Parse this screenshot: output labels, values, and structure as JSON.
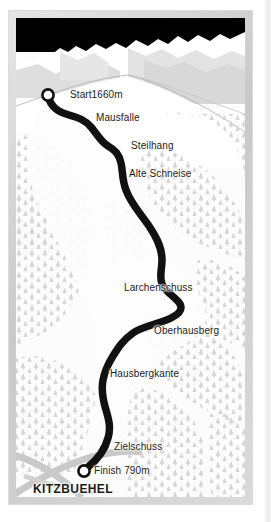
{
  "map": {
    "title_region": "Kitzbuehel downhill course map",
    "town_label": "KITZBUEHEL",
    "start_marker": {
      "label": "Start1660m",
      "x": 41,
      "y": 87
    },
    "finish_marker": {
      "label": "Finish 790m",
      "x": 77,
      "y": 463
    },
    "section_labels": [
      {
        "text": "Mausfalle",
        "x": 84,
        "y": 101
      },
      {
        "text": "Steilhang",
        "x": 119,
        "y": 129
      },
      {
        "text": "Alte Schneise",
        "x": 126,
        "y": 158
      },
      {
        "text": "Larchenschuss",
        "x": 123,
        "y": 275
      },
      {
        "text": "Oberhausberg",
        "x": 150,
        "y": 318
      },
      {
        "text": "Hausbergkante",
        "x": 108,
        "y": 360
      },
      {
        "text": "Zielschuss",
        "x": 110,
        "y": 433
      }
    ],
    "colors": {
      "sky": "#000000",
      "snow": "#ffffff",
      "mountain_shadow": "#d9d9d9",
      "course_line": "#111111",
      "forest": "#d5d5d5",
      "road": "#c6c6c6",
      "frame": "#cfcfcf",
      "label_text": "#1c1c1c"
    },
    "course_path": "M 41 88 C 44 100, 52 104, 62 107 C 72 110, 78 112, 84 119 C 90 126, 94 134, 101 138 C 108 142, 112 146, 114 155 C 116 164, 115 172, 119 182 C 124 196, 134 206, 142 218 C 150 230, 155 240, 155 252 C 155 262, 152 268, 155 276 C 159 285, 170 290, 173 296 C 176 302, 172 306, 164 310 C 152 316, 136 318, 126 325 C 116 332, 111 340, 106 348 C 101 356, 98 362, 96 372 C 94 382, 96 392, 99 402 C 102 412, 104 420, 101 430 C 98 442, 90 452, 80 460"
  }
}
